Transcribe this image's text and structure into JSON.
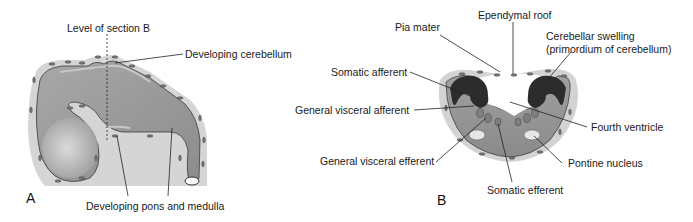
{
  "panel_a": {
    "letter": "A",
    "labels": {
      "section_level": "Level of section B",
      "cerebellum": "Developing cerebellum",
      "pons_medulla": "Developing pons and medulla"
    }
  },
  "panel_b": {
    "letter": "B",
    "labels": {
      "ependymal_roof": "Ependymal roof",
      "pia_mater": "Pia mater",
      "cerebellar_swelling_1": "Cerebellar swelling",
      "cerebellar_swelling_2": "(primordium of cerebellum)",
      "somatic_afferent": "Somatic afferent",
      "general_visceral_afferent": "General visceral afferent",
      "fourth_ventricle": "Fourth ventricle",
      "general_visceral_efferent": "General visceral efferent",
      "pontine_nucleus": "Pontine nucleus",
      "somatic_efferent": "Somatic efferent"
    }
  },
  "colors": {
    "mesenchyme": "#d4d4d4",
    "neural_tissue": "#9a9a9a",
    "dark_layer": "#2e2e2e",
    "nucleus": "#7a7a7a",
    "light_nucleus": "#e6e6e6"
  }
}
